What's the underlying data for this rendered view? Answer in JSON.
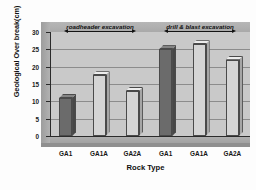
{
  "chart_data": {
    "type": "bar",
    "title": "",
    "xlabel": "Rock Type",
    "ylabel": "Geological Over break(cm)",
    "categories": [
      "GA1",
      "GA1A",
      "GA2A",
      "GA1",
      "GA1A",
      "GA2A"
    ],
    "values": [
      11,
      17.5,
      13,
      25,
      26.5,
      22
    ],
    "ylim": [
      0,
      30
    ],
    "yticks": [
      0,
      5,
      10,
      15,
      20,
      25,
      30
    ],
    "ytick_labels": [
      "0",
      "5",
      "10",
      "15",
      "20",
      "25",
      "30"
    ],
    "grid": true,
    "legend": "none",
    "bar_colors": [
      "#6b6b6b",
      "#d5d5d5",
      "#d5d5d5",
      "#6b6b6b",
      "#d5d5d5",
      "#d5d5d5"
    ],
    "annotations": [
      {
        "text": "roadheader  excavation",
        "spans_categories": [
          0,
          2
        ]
      },
      {
        "text": "drill & blast excavation",
        "spans_categories": [
          3,
          5
        ]
      }
    ],
    "style": "3d-column",
    "plot_background": "#c9c9c9"
  }
}
